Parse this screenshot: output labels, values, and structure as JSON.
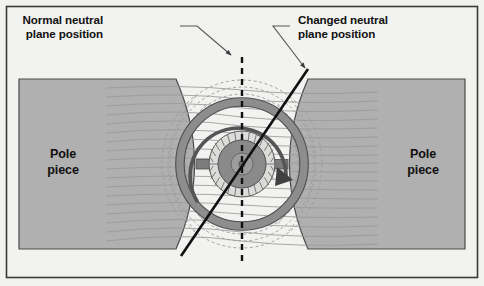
{
  "figure": {
    "background_color": "#f2f2f0",
    "frame_color": "#3a3a3a",
    "metal_gray": "#b0b0b0",
    "metal_stroke": "#555555",
    "flux_line_color": "#9a9a9a",
    "dashed_flux_color": "#9a9a9a",
    "neutral_plane_color": "#111111",
    "rotor_core_color": "#8f8f8f",
    "rotor_slot_color": "#d8d8d6"
  },
  "callouts": [
    {
      "id": "normal-neutral-plane",
      "line1": "Normal neutral",
      "line2": "plane position",
      "text_x": 103,
      "text_y": 24,
      "leader": "M 180 26 L 197 26 L 233 57",
      "arrow_at": [
        233,
        57
      ]
    },
    {
      "id": "changed-neutral-plane",
      "line1": "Changed neutral",
      "line2": "plane position",
      "text_x": 298,
      "text_y": 24,
      "leader": "M 290 26 L 273 26 L 307 70",
      "arrow_at": [
        307,
        70
      ]
    }
  ],
  "pole_pieces": [
    {
      "id": "left-pole-piece",
      "line1": "Pole",
      "line2": "piece",
      "text_x": 63,
      "text_y": 152
    },
    {
      "id": "right-pole-piece",
      "line1": "Pole",
      "line2": "piece",
      "text_x": 423,
      "text_y": 152
    }
  ],
  "neutral_planes": {
    "normal": {
      "label": "normal neutral plane",
      "style": "dashed vertical",
      "x": 242,
      "y_top": 57,
      "y_bottom": 266
    },
    "changed": {
      "label": "changed neutral plane",
      "style": "solid diagonal",
      "x1": 181,
      "y1": 256,
      "x2": 308,
      "y2": 69
    }
  },
  "rotation": {
    "direction": "clockwise",
    "arrow_start_deg": 195,
    "arrow_end_deg": 20
  },
  "geometry": {
    "center_x": 242,
    "center_y": 164,
    "armature_outer_r": 62,
    "armature_inner_r": 54,
    "rotor_outer_r": 33,
    "rotor_core_r": 24,
    "slot_count": 28,
    "brush_half_width": 10
  },
  "flux_lines": {
    "count_per_side": 17,
    "description": "horizontal main-field lines crowding through the air gap"
  }
}
